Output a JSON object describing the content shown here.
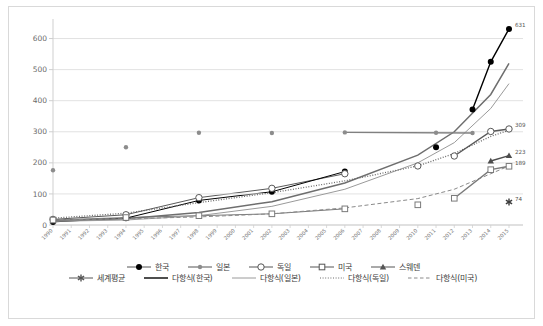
{
  "chart_data": {
    "type": "scatter",
    "title": "",
    "subtitle": "",
    "xlabel": "",
    "ylabel": "",
    "grid": true,
    "legend_position": "bottom",
    "xlim": [
      1990,
      2015
    ],
    "ylim": [
      0,
      650
    ],
    "yticks": [
      0,
      100,
      200,
      300,
      400,
      500,
      600
    ],
    "ytick_labels": [
      "0",
      "100",
      "200",
      "300",
      "400",
      "500",
      "600"
    ],
    "categories": [
      "1990",
      "1991",
      "1992",
      "1993",
      "1994",
      "1995",
      "1996",
      "1997",
      "1998",
      "1999",
      "2000",
      "2001",
      "2002",
      "2003",
      "2004",
      "2005",
      "2006",
      "2007",
      "2008",
      "2009",
      "2010",
      "2011",
      "2012",
      "2013",
      "2014",
      "2015"
    ],
    "series": [
      {
        "name": "한국",
        "marker": "filled-circle",
        "color": "#000000",
        "points": [
          {
            "x": "1990",
            "y": 10
          },
          {
            "x": "1994",
            "y": 22
          },
          {
            "x": "1998",
            "y": 79
          },
          {
            "x": "2002",
            "y": 107
          },
          {
            "x": "2006",
            "y": 172
          },
          {
            "x": "2011",
            "y": 250
          },
          {
            "x": "2013",
            "y": 372
          },
          {
            "x": "2014",
            "y": 525
          },
          {
            "x": "2015",
            "y": 631
          }
        ],
        "end_label": "631"
      },
      {
        "name": "일본",
        "marker": "small-gray-circle",
        "color": "#808080",
        "points": [
          {
            "x": "1990",
            "y": 176
          },
          {
            "x": "1994",
            "y": 250
          },
          {
            "x": "1998",
            "y": 297
          },
          {
            "x": "2002",
            "y": 296
          },
          {
            "x": "2006",
            "y": 298
          },
          {
            "x": "2011",
            "y": 297
          },
          {
            "x": "2013",
            "y": 296
          }
        ]
      },
      {
        "name": "독일",
        "marker": "open-circle",
        "color": "#595959",
        "points": [
          {
            "x": "1990",
            "y": 18
          },
          {
            "x": "1994",
            "y": 33
          },
          {
            "x": "1998",
            "y": 88
          },
          {
            "x": "2002",
            "y": 118
          },
          {
            "x": "2006",
            "y": 165
          },
          {
            "x": "2010",
            "y": 190
          },
          {
            "x": "2012",
            "y": 222
          },
          {
            "x": "2014",
            "y": 301
          },
          {
            "x": "2015",
            "y": 309
          }
        ],
        "end_label": "309"
      },
      {
        "name": "미국",
        "marker": "open-square",
        "color": "#7a7a7a",
        "points": [
          {
            "x": "1990",
            "y": 16
          },
          {
            "x": "1994",
            "y": 24
          },
          {
            "x": "1998",
            "y": 30
          },
          {
            "x": "2002",
            "y": 36
          },
          {
            "x": "2006",
            "y": 52
          },
          {
            "x": "2010",
            "y": 65
          },
          {
            "x": "2012",
            "y": 86
          },
          {
            "x": "2014",
            "y": 178
          },
          {
            "x": "2015",
            "y": 189
          }
        ],
        "end_label": "189"
      },
      {
        "name": "스웨덴",
        "marker": "filled-triangle",
        "color": "#4d4d4d",
        "points": [
          {
            "x": "2014",
            "y": 206
          },
          {
            "x": "2015",
            "y": 223
          }
        ],
        "end_label": "223"
      },
      {
        "name": "세계평균",
        "marker": "asterisk",
        "color": "#3c3c3c",
        "points": [
          {
            "x": "2015",
            "y": 74
          }
        ],
        "end_label": "74"
      }
    ],
    "trendlines": [
      {
        "name": "다항식(한국)",
        "style": "solid-thick",
        "color": "#6e6e6e",
        "path": [
          [
            1990,
            14
          ],
          [
            1994,
            20
          ],
          [
            1998,
            40
          ],
          [
            2002,
            75
          ],
          [
            2006,
            135
          ],
          [
            2010,
            225
          ],
          [
            2012,
            300
          ],
          [
            2014,
            420
          ],
          [
            2015,
            520
          ]
        ]
      },
      {
        "name": "다항식(일본)",
        "style": "solid-thin",
        "color": "#9a9a9a",
        "path": [
          [
            1990,
            12
          ],
          [
            1994,
            16
          ],
          [
            1998,
            30
          ],
          [
            2002,
            60
          ],
          [
            2006,
            115
          ],
          [
            2010,
            200
          ],
          [
            2012,
            265
          ],
          [
            2014,
            375
          ],
          [
            2015,
            455
          ]
        ]
      },
      {
        "name": "다항식(독일)",
        "style": "dotted",
        "color": "#6a6a6a",
        "path": [
          [
            1990,
            22
          ],
          [
            1994,
            38
          ],
          [
            1998,
            72
          ],
          [
            2002,
            104
          ],
          [
            2006,
            142
          ],
          [
            2010,
            190
          ],
          [
            2012,
            230
          ],
          [
            2014,
            285
          ],
          [
            2015,
            305
          ]
        ]
      },
      {
        "name": "다항식(미국)",
        "style": "dashed",
        "color": "#8a8a8a",
        "path": [
          [
            1990,
            17
          ],
          [
            1994,
            20
          ],
          [
            1998,
            26
          ],
          [
            2002,
            36
          ],
          [
            2006,
            55
          ],
          [
            2010,
            85
          ],
          [
            2012,
            115
          ],
          [
            2014,
            165
          ],
          [
            2015,
            190
          ]
        ]
      }
    ],
    "legend": [
      {
        "label": "한국",
        "marker": "filled-circle",
        "line": "solid"
      },
      {
        "label": "일본",
        "marker": "small-gray-circle",
        "line": "solid"
      },
      {
        "label": "독일",
        "marker": "open-circle",
        "line": "solid"
      },
      {
        "label": "미국",
        "marker": "open-square",
        "line": "solid"
      },
      {
        "label": "스웨덴",
        "marker": "filled-triangle",
        "line": "solid"
      },
      {
        "label": "세계평균",
        "marker": "asterisk",
        "line": "solid"
      },
      {
        "label": "다항식(한국)",
        "marker": "none",
        "line": "solid-thick"
      },
      {
        "label": "다항식(일본)",
        "marker": "none",
        "line": "solid-thin"
      },
      {
        "label": "다항식(독일)",
        "marker": "none",
        "line": "dotted"
      },
      {
        "label": "다항식(미국)",
        "marker": "none",
        "line": "dashed"
      }
    ],
    "colors": {
      "grid": "#e2e2e2",
      "axis": "#cfcfcf",
      "border": "#d9d9d9",
      "background": "#ffffff",
      "text": "#6b6b6b"
    }
  }
}
